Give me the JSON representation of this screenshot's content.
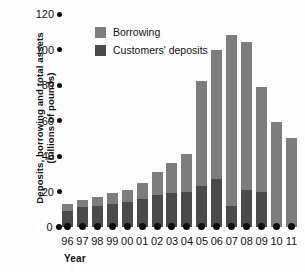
{
  "chart_data": {
    "type": "bar",
    "stacked": true,
    "title": "",
    "xlabel": "Year",
    "ylabel": "Deposits, borrowing and total assets (billions of pounds)",
    "ylabel_line1": "Deposits, borrowing and total assets",
    "ylabel_line2": "(billions of pounds)",
    "ylim": [
      0,
      120
    ],
    "yticks": [
      0,
      20,
      40,
      60,
      80,
      100,
      120
    ],
    "ytick_labels": [
      "0",
      "20",
      "40",
      "60",
      "80",
      "100",
      "120"
    ],
    "grid": false,
    "legend_position": "upper-left-inside",
    "categories": [
      "96",
      "97",
      "98",
      "99",
      "00",
      "01",
      "02",
      "03",
      "04",
      "05",
      "06",
      "07",
      "08",
      "09",
      "10",
      "11"
    ],
    "series": [
      {
        "name": "Customers' deposits",
        "color": "#4a4a4a",
        "values": [
          9,
          11,
          12,
          13,
          14,
          16,
          18,
          19,
          20,
          23,
          27,
          12,
          21,
          20,
          0,
          0
        ]
      },
      {
        "name": "Borrowing",
        "color": "#7d7d7d",
        "values": [
          4,
          4,
          5,
          6,
          7,
          9,
          13,
          17,
          21,
          59,
          73,
          96,
          83,
          59,
          59,
          50
        ]
      }
    ],
    "totals": [
      13,
      15,
      17,
      19,
      21,
      25,
      31,
      36,
      41,
      82,
      100,
      108,
      104,
      79,
      59,
      50
    ]
  },
  "legend": {
    "items": [
      {
        "label": "Borrowing",
        "color": "#7d7d7d"
      },
      {
        "label": "Customers' deposits",
        "color": "#4a4a4a"
      }
    ]
  }
}
